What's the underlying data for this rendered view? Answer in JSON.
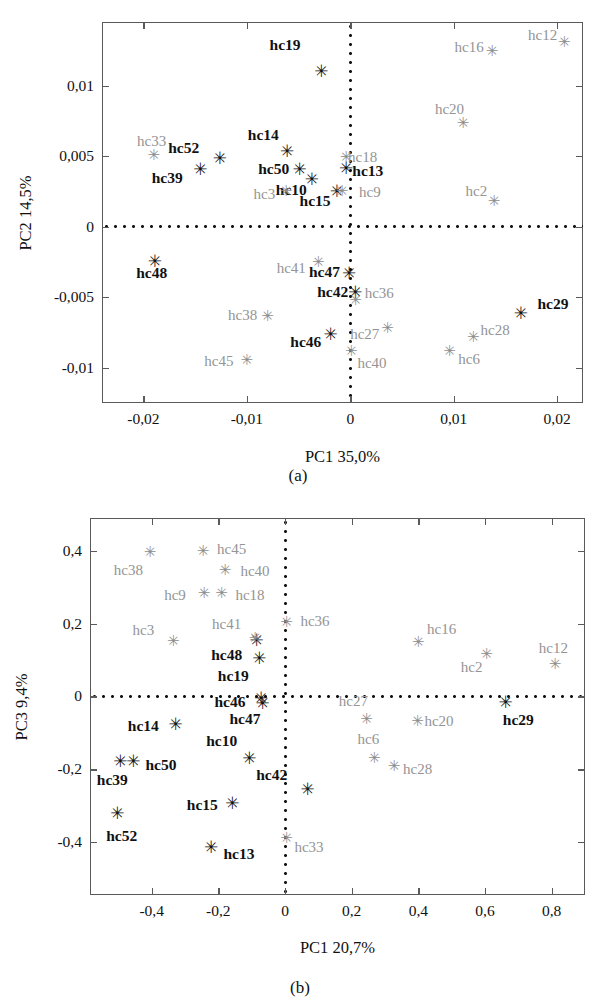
{
  "figure": {
    "type": "scientific-figure",
    "panel_count": 2,
    "marker_glyph": "✳",
    "colors": {
      "dark_series": "#111111",
      "gray_series": "#909090",
      "frame": "#5a5a5a",
      "background": "#ffffff"
    }
  },
  "chart_data": [
    {
      "type": "scatter",
      "panel": "a",
      "caption": "(a)",
      "title": "",
      "xlabel": "PC1  35,0%",
      "ylabel": "PC2  14,5%",
      "xlim": [
        -0.024,
        0.0225
      ],
      "ylim": [
        -0.0125,
        0.0145
      ],
      "grid": false,
      "legend": "none",
      "zero_lines": {
        "x": 0,
        "y": 0,
        "style": "dotted"
      },
      "xticks": [
        -0.02,
        -0.01,
        0,
        0.01,
        0.02
      ],
      "xticklabels": [
        "-0,02",
        "-0,01",
        "0",
        "0,01",
        "0,02"
      ],
      "yticks": [
        0.01,
        0.005,
        0,
        -0.005,
        -0.01
      ],
      "yticklabels": [
        "0,01",
        "0,005",
        "0",
        "-0,005",
        "-0,01"
      ],
      "series": [
        {
          "name": "dark",
          "color": "#111111",
          "points": [
            {
              "label": "hc19",
              "x": -0.0028,
              "y": 0.01105,
              "lx": -0.0063,
              "ly": 0.01285
            },
            {
              "label": "hc52",
              "x": -0.0126,
              "y": 0.00485,
              "lx": -0.0161,
              "ly": 0.00555
            },
            {
              "label": "hc14",
              "x": -0.0061,
              "y": 0.00535,
              "lx": -0.0084,
              "ly": 0.0065
            },
            {
              "label": "hc39",
              "x": -0.0145,
              "y": 0.00405,
              "lx": -0.0177,
              "ly": 0.00345
            },
            {
              "label": "hc50",
              "x": -0.0049,
              "y": 0.00405,
              "lx": -0.0074,
              "ly": 0.0041
            },
            {
              "label": "hc13",
              "x": -0.0004,
              "y": 0.00415,
              "lx": 0.0017,
              "ly": 0.00395
            },
            {
              "label": "hc10",
              "x": -0.0037,
              "y": 0.0034,
              "lx": -0.0057,
              "ly": 0.0026
            },
            {
              "label": "hc15",
              "x": -0.0013,
              "y": 0.00255,
              "lx": -0.0034,
              "ly": 0.0018
            },
            {
              "label": "hc48",
              "x": -0.0189,
              "y": -0.00245,
              "lx": -0.0192,
              "ly": -0.0033
            },
            {
              "label": "hc47",
              "x": -0.0001,
              "y": -0.0033,
              "lx": -0.0025,
              "ly": -0.00325
            },
            {
              "label": "hc42",
              "x": 0.0005,
              "y": -0.00465,
              "lx": -0.0017,
              "ly": -0.00465
            },
            {
              "label": "hc46",
              "x": -0.0019,
              "y": -0.0076,
              "lx": -0.0043,
              "ly": -0.00815
            },
            {
              "label": "hc29",
              "x": 0.0165,
              "y": -0.0061,
              "lx": 0.0196,
              "ly": -0.00545
            }
          ]
        },
        {
          "name": "gray",
          "color": "#909090",
          "points": [
            {
              "label": "hc12",
              "x": 0.0207,
              "y": 0.0131,
              "lx": 0.0186,
              "ly": 0.01355
            },
            {
              "label": "hc16",
              "x": 0.0137,
              "y": 0.01245,
              "lx": 0.0115,
              "ly": 0.01275
            },
            {
              "label": "hc20",
              "x": 0.0109,
              "y": 0.00735,
              "lx": 0.0096,
              "ly": 0.00835
            },
            {
              "label": "hc33",
              "x": -0.019,
              "y": 0.00505,
              "lx": -0.0192,
              "ly": 0.00605
            },
            {
              "label": "hc18",
              "x": -0.0004,
              "y": 0.00495,
              "lx": 0.0012,
              "ly": 0.0049
            },
            {
              "label": "hc3",
              "x": -0.0062,
              "y": 0.0025,
              "lx": -0.0083,
              "ly": 0.0023
            },
            {
              "label": "hc9",
              "x": -0.0008,
              "y": 0.00255,
              "lx": 0.0019,
              "ly": 0.00245
            },
            {
              "label": "hc2",
              "x": 0.0139,
              "y": 0.0018,
              "lx": 0.0122,
              "ly": 0.00255
            },
            {
              "label": "hc41",
              "x": -0.0031,
              "y": -0.0025,
              "lx": -0.0057,
              "ly": -0.0029
            },
            {
              "label": "hc36",
              "x": 0.0005,
              "y": -0.0052,
              "lx": 0.0028,
              "ly": -0.0047
            },
            {
              "label": "hc38",
              "x": -0.008,
              "y": -0.0063,
              "lx": -0.0104,
              "ly": -0.00625
            },
            {
              "label": "hc27",
              "x": 0.0036,
              "y": -0.0072,
              "lx": 0.0014,
              "ly": -0.0076
            },
            {
              "label": "hc28",
              "x": 0.0119,
              "y": -0.0078,
              "lx": 0.014,
              "ly": -0.0073
            },
            {
              "label": "hc45",
              "x": -0.01,
              "y": -0.00945,
              "lx": -0.0127,
              "ly": -0.0095
            },
            {
              "label": "hc40",
              "x": 0.0001,
              "y": -0.00885,
              "lx": 0.0021,
              "ly": -0.00965
            },
            {
              "label": "hc6",
              "x": 0.0096,
              "y": -0.00885,
              "lx": 0.0115,
              "ly": -0.00935
            }
          ]
        }
      ]
    },
    {
      "type": "scatter",
      "panel": "b",
      "caption": "(b)",
      "title": "",
      "xlabel": "PC1  20,7%",
      "ylabel": "PC3  9,4%",
      "xlim": [
        -0.585,
        0.9
      ],
      "ylim": [
        -0.545,
        0.49
      ],
      "grid": false,
      "legend": "none",
      "zero_lines": {
        "x": 0,
        "y": 0,
        "style": "dotted"
      },
      "xticks": [
        -0.4,
        -0.2,
        0,
        0.2,
        0.4,
        0.6,
        0.8
      ],
      "xticklabels": [
        "-0,4",
        "-0,2",
        "0",
        "0,2",
        "0,4",
        "0,6",
        "0,8"
      ],
      "yticks": [
        0.4,
        0.2,
        0,
        -0.2,
        -0.4
      ],
      "yticklabels": [
        "0,4",
        "0,2",
        "0",
        "-0,2",
        "-0,4"
      ],
      "series": [
        {
          "name": "dark",
          "color": "#111111",
          "points": [
            {
              "label": "hc48",
              "x": -0.085,
              "y": 0.155,
              "lx": -0.175,
              "ly": 0.115
            },
            {
              "label": "hc19",
              "x": -0.077,
              "y": 0.105,
              "lx": -0.155,
              "ly": 0.055
            },
            {
              "label": "hc46",
              "x": -0.072,
              "y": -0.005,
              "lx": -0.165,
              "ly": -0.015
            },
            {
              "label": "hc47",
              "x": -0.067,
              "y": -0.018,
              "lx": -0.12,
              "ly": -0.062
            },
            {
              "label": "hc14",
              "x": -0.328,
              "y": -0.075,
              "lx": -0.425,
              "ly": -0.082
            },
            {
              "label": "hc10",
              "x": -0.107,
              "y": -0.168,
              "lx": -0.19,
              "ly": -0.122
            },
            {
              "label": "hc50",
              "x": -0.455,
              "y": -0.178,
              "lx": -0.372,
              "ly": -0.188
            },
            {
              "label": "hc39",
              "x": -0.494,
              "y": -0.178,
              "lx": -0.518,
              "ly": -0.228
            },
            {
              "label": "hc42",
              "x": 0.068,
              "y": -0.253,
              "lx": -0.04,
              "ly": -0.215
            },
            {
              "label": "hc15",
              "x": -0.158,
              "y": -0.292,
              "lx": -0.248,
              "ly": -0.298
            },
            {
              "label": "hc52",
              "x": -0.503,
              "y": -0.32,
              "lx": -0.49,
              "ly": -0.382
            },
            {
              "label": "hc13",
              "x": -0.222,
              "y": -0.412,
              "lx": -0.138,
              "ly": -0.432
            },
            {
              "label": "hc29",
              "x": 0.662,
              "y": -0.015,
              "lx": 0.7,
              "ly": -0.065
            }
          ]
        },
        {
          "name": "gray",
          "color": "#909090",
          "points": [
            {
              "label": "hc38",
              "x": -0.405,
              "y": 0.398,
              "lx": -0.47,
              "ly": 0.348
            },
            {
              "label": "hc45",
              "x": -0.246,
              "y": 0.4,
              "lx": -0.16,
              "ly": 0.405
            },
            {
              "label": "hc40",
              "x": -0.18,
              "y": 0.348,
              "lx": -0.09,
              "ly": 0.345
            },
            {
              "label": "hc9",
              "x": -0.243,
              "y": 0.283,
              "lx": -0.33,
              "ly": 0.278
            },
            {
              "label": "hc18",
              "x": -0.19,
              "y": 0.283,
              "lx": -0.105,
              "ly": 0.278
            },
            {
              "label": "hc41",
              "x": -0.09,
              "y": 0.16,
              "lx": -0.175,
              "ly": 0.198
            },
            {
              "label": "hc36",
              "x": 0.005,
              "y": 0.205,
              "lx": 0.09,
              "ly": 0.207
            },
            {
              "label": "hc3",
              "x": -0.335,
              "y": 0.152,
              "lx": -0.425,
              "ly": 0.182
            },
            {
              "label": "hc16",
              "x": 0.4,
              "y": 0.15,
              "lx": 0.47,
              "ly": 0.185
            },
            {
              "label": "hc2",
              "x": 0.605,
              "y": 0.117,
              "lx": 0.56,
              "ly": 0.082
            },
            {
              "label": "hc12",
              "x": 0.81,
              "y": 0.088,
              "lx": 0.805,
              "ly": 0.132
            },
            {
              "label": "hc27",
              "x": 0.245,
              "y": -0.063,
              "lx": 0.205,
              "ly": -0.012
            },
            {
              "label": "hc20",
              "x": 0.398,
              "y": -0.068,
              "lx": 0.462,
              "ly": -0.068
            },
            {
              "label": "hc6",
              "x": 0.268,
              "y": -0.168,
              "lx": 0.25,
              "ly": -0.118
            },
            {
              "label": "hc28",
              "x": 0.327,
              "y": -0.192,
              "lx": 0.398,
              "ly": -0.198
            },
            {
              "label": "hc33",
              "x": 0.005,
              "y": -0.388,
              "lx": 0.072,
              "ly": -0.412
            }
          ]
        }
      ]
    }
  ]
}
